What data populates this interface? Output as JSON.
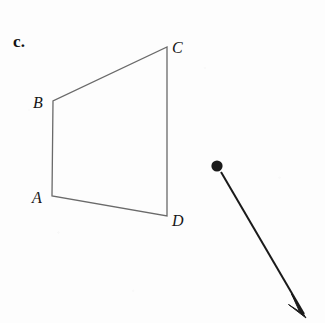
{
  "page": {
    "background_color": "#fdfdfd",
    "width": 325,
    "height": 323
  },
  "part_label": {
    "text": "c.",
    "x": 13,
    "y": 33,
    "color": "#111111"
  },
  "figure": {
    "type": "geometry-diagram",
    "name": "quadrilateral-abcd-with-vector",
    "shape": {
      "name": "quadrilateral-abcd",
      "stroke_color": "#6a6a6a",
      "stroke_width": 1.3,
      "fill": "none",
      "closed": true,
      "points": "52,196 53,101 167,47 167,216",
      "vertices": [
        {
          "id": "A",
          "x": 52,
          "y": 196
        },
        {
          "id": "B",
          "x": 53,
          "y": 101
        },
        {
          "id": "C",
          "x": 167,
          "y": 47
        },
        {
          "id": "D",
          "x": 167,
          "y": 216
        }
      ],
      "edges": [
        {
          "from": "A",
          "to": "B"
        },
        {
          "from": "B",
          "to": "C"
        },
        {
          "from": "C",
          "to": "D"
        },
        {
          "from": "D",
          "to": "A"
        }
      ]
    },
    "vertex_labels": [
      {
        "id": "label-b",
        "text": "B",
        "x": 33,
        "y": 95
      },
      {
        "id": "label-c",
        "text": "C",
        "x": 172,
        "y": 40
      },
      {
        "id": "label-a",
        "text": "A",
        "x": 32,
        "y": 190
      },
      {
        "id": "label-d",
        "text": "D",
        "x": 172,
        "y": 213
      }
    ],
    "vector": {
      "name": "translation-vector-arrow",
      "color": "#1a1a1a",
      "stroke_width": 2.0,
      "dot": {
        "cx": 217,
        "cy": 166,
        "r": 5.6
      },
      "tail": {
        "x": 221,
        "y": 172
      },
      "tip": {
        "x": 306,
        "y": 317
      },
      "arrowhead": {
        "length": 17,
        "half_width": 5,
        "points": "306,317 292,295 299,312 289,305"
      }
    }
  }
}
